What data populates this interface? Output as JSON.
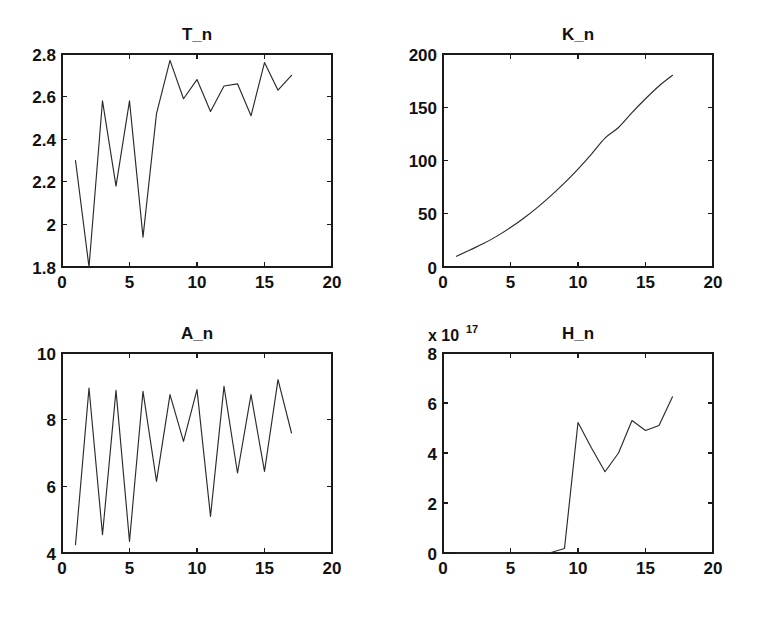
{
  "figure": {
    "background_color": "#ffffff",
    "line_color": "#2b2b2b",
    "axis_color": "#1a1a1a",
    "width": 762,
    "height": 618,
    "layout": "2x2 subplot grid"
  },
  "chart_data": [
    {
      "type": "line",
      "title": "T_n",
      "xlabel": "",
      "ylabel": "",
      "xlim": [
        0,
        20
      ],
      "ylim": [
        1.8,
        2.8
      ],
      "xticks": [
        0,
        5,
        10,
        15,
        20
      ],
      "yticks": [
        1.8,
        2,
        2.2,
        2.4,
        2.6,
        2.8
      ],
      "xtick_labels": [
        "0",
        "5",
        "10",
        "15",
        "20"
      ],
      "ytick_labels": [
        "1.8",
        "2",
        "2.2",
        "2.4",
        "2.6",
        "2.8"
      ],
      "grid": false,
      "legend": false,
      "x": [
        1,
        2,
        3,
        4,
        5,
        6,
        7,
        8,
        9,
        10,
        11,
        12,
        13,
        14,
        15,
        16,
        17
      ],
      "values": [
        2.3,
        1.8,
        2.58,
        2.18,
        2.58,
        1.94,
        2.52,
        2.77,
        2.59,
        2.68,
        2.53,
        2.65,
        2.66,
        2.51,
        2.76,
        2.63,
        2.7
      ]
    },
    {
      "type": "line",
      "title": "K_n",
      "xlabel": "",
      "ylabel": "",
      "xlim": [
        0,
        20
      ],
      "ylim": [
        0,
        200
      ],
      "xticks": [
        0,
        5,
        10,
        15,
        20
      ],
      "yticks": [
        0,
        50,
        100,
        150,
        200
      ],
      "xtick_labels": [
        "0",
        "5",
        "10",
        "15",
        "20"
      ],
      "ytick_labels": [
        "0",
        "50",
        "100",
        "150",
        "200"
      ],
      "grid": false,
      "legend": false,
      "x": [
        1,
        2,
        3,
        4,
        5,
        6,
        7,
        8,
        9,
        10,
        11,
        12,
        13,
        14,
        15,
        16,
        17
      ],
      "values": [
        10,
        16,
        22,
        29,
        37,
        46,
        56,
        67,
        79,
        92,
        106,
        121,
        131,
        145,
        158,
        170,
        180
      ]
    },
    {
      "type": "line",
      "title": "A_n",
      "xlabel": "",
      "ylabel": "",
      "xlim": [
        0,
        20
      ],
      "ylim": [
        4,
        10
      ],
      "xticks": [
        0,
        5,
        10,
        15,
        20
      ],
      "yticks": [
        4,
        6,
        8,
        10
      ],
      "xtick_labels": [
        "0",
        "5",
        "10",
        "15",
        "20"
      ],
      "ytick_labels": [
        "4",
        "6",
        "8",
        "10"
      ],
      "grid": false,
      "legend": false,
      "x": [
        1,
        2,
        3,
        4,
        5,
        6,
        7,
        8,
        9,
        10,
        11,
        12,
        13,
        14,
        15,
        16,
        17
      ],
      "values": [
        4.25,
        8.95,
        4.55,
        8.88,
        4.35,
        8.85,
        6.15,
        8.75,
        7.35,
        8.9,
        5.1,
        9.0,
        6.4,
        8.75,
        6.45,
        9.2,
        7.6
      ]
    },
    {
      "type": "line",
      "title": "H_n",
      "xlabel": "",
      "ylabel": "",
      "exponent_label": "x 10",
      "exponent_value": "17",
      "y_scale": 1e+17,
      "xlim": [
        0,
        20
      ],
      "ylim": [
        0,
        8
      ],
      "xticks": [
        0,
        5,
        10,
        15,
        20
      ],
      "yticks": [
        0,
        2,
        4,
        6,
        8
      ],
      "xtick_labels": [
        "0",
        "5",
        "10",
        "15",
        "20"
      ],
      "ytick_labels": [
        "0",
        "2",
        "4",
        "6",
        "8"
      ],
      "grid": false,
      "legend": false,
      "x": [
        1,
        2,
        3,
        4,
        5,
        6,
        7,
        8,
        9,
        10,
        11,
        12,
        13,
        14,
        15,
        16,
        17
      ],
      "values": [
        0.0,
        0.0,
        0.0,
        0.0,
        0.0,
        0.0,
        0.0,
        0.02,
        0.18,
        5.22,
        4.2,
        3.25,
        4.0,
        5.3,
        4.9,
        5.1,
        6.25,
        3.6,
        5.35
      ]
    }
  ]
}
